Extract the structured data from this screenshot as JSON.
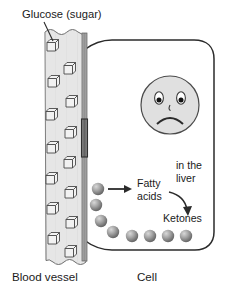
{
  "diagram": {
    "title_label": "Glucose (sugar)",
    "bottom_labels": {
      "left": "Blood vessel",
      "right": "Cell"
    },
    "inner_labels": {
      "fatty_acids_line1": "Fatty",
      "fatty_acids_line2": "acids",
      "in_the_liver_line1": "in the",
      "in_the_liver_line2": "liver",
      "ketones": "Ketones"
    },
    "colors": {
      "vessel_fill": "#e3e3e3",
      "vessel_wall": "#9a9a9a",
      "vessel_gap": "#6f6f6f",
      "outline": "#2b2b2b",
      "face_fill": "#e0e0e0",
      "sphere_light": "#cfcfcf",
      "sphere_dark": "#6a6a6a",
      "text": "#1a1a1a",
      "background": "#ffffff"
    },
    "glucose_cubes_count": 14,
    "fatty_acid_spheres_count": 8,
    "face_expression": "sad"
  }
}
